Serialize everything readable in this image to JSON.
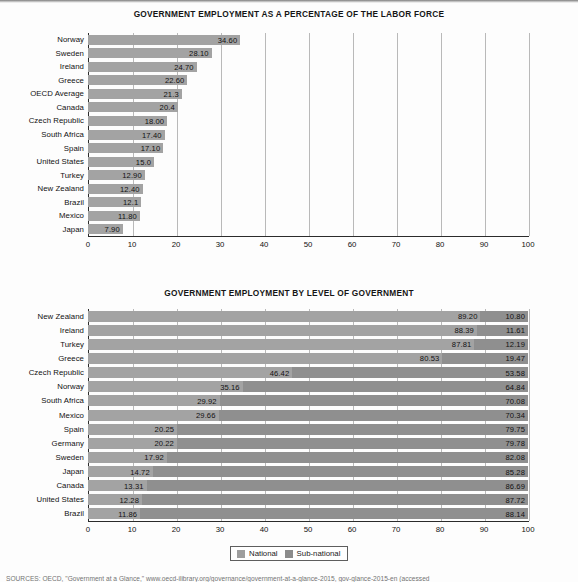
{
  "document": {
    "source_note": "SOURCES: OECD, \"Government at a Glance,\" www.oecd-ilibrary.org/governance/government-at-a-glance-2015, gov-glance-2015-en (accessed"
  },
  "legend": {
    "items": [
      {
        "label": "National",
        "color": "#9e9e9e"
      },
      {
        "label": "Sub-national",
        "color": "#8c8c8c"
      }
    ]
  },
  "chart_data": [
    {
      "type": "bar",
      "orientation": "horizontal",
      "title": "GOVERNMENT EMPLOYMENT AS A PERCENTAGE OF THE LABOR FORCE",
      "xlabel": "",
      "ylabel": "",
      "xlim": [
        0,
        100
      ],
      "xticks": [
        0,
        10,
        20,
        30,
        40,
        50,
        60,
        70,
        80,
        90,
        100
      ],
      "grid": true,
      "bar_color": "#a3a3a3",
      "categories": [
        "Norway",
        "Sweden",
        "Ireland",
        "Greece",
        "OECD Average",
        "Canada",
        "Czech Republic",
        "South Africa",
        "Spain",
        "United States",
        "Turkey",
        "New Zealand",
        "Brazil",
        "Mexico",
        "Japan"
      ],
      "values": [
        34.6,
        28.1,
        24.7,
        22.6,
        21.3,
        20.4,
        18.0,
        17.4,
        17.1,
        15.0,
        12.9,
        12.4,
        12.1,
        11.8,
        7.9
      ],
      "labels": [
        "34.60",
        "28.10",
        "24.70",
        "22.60",
        "21.3",
        "20.4",
        "18.00",
        "17.40",
        "17.10",
        "15.0",
        "12.90",
        "12.40",
        "12.1",
        "11.80",
        "7.90"
      ]
    },
    {
      "type": "bar",
      "orientation": "horizontal",
      "stacked": true,
      "title": "GOVERNMENT EMPLOYMENT BY LEVEL OF GOVERNMENT",
      "xlabel": "",
      "ylabel": "",
      "xlim": [
        0,
        100
      ],
      "xticks": [
        0,
        10,
        20,
        30,
        40,
        50,
        60,
        70,
        80,
        90,
        100
      ],
      "grid": true,
      "legend_position": "bottom-center",
      "categories": [
        "New Zealand",
        "Ireland",
        "Turkey",
        "Greece",
        "Czech Republic",
        "Norway",
        "South Africa",
        "Mexico",
        "Spain",
        "Germany",
        "Sweden",
        "Japan",
        "Canada",
        "United States",
        "Brazil"
      ],
      "series": [
        {
          "name": "National",
          "color": "#a3a3a3",
          "values": [
            89.2,
            88.39,
            87.81,
            80.53,
            46.42,
            35.16,
            29.92,
            29.66,
            20.25,
            20.22,
            17.92,
            14.72,
            13.31,
            12.28,
            11.86
          ],
          "labels": [
            "89.20",
            "88.39",
            "87.81",
            "80.53",
            "46.42",
            "35.16",
            "29.92",
            "29.66",
            "20.25",
            "20.22",
            "17.92",
            "14.72",
            "13.31",
            "12.28",
            "11.86"
          ]
        },
        {
          "name": "Sub-national",
          "color": "#8f8f8f",
          "values": [
            10.8,
            11.61,
            12.19,
            19.47,
            53.58,
            64.84,
            70.08,
            70.34,
            79.75,
            79.78,
            82.08,
            85.28,
            86.69,
            87.72,
            88.14
          ],
          "labels": [
            "10.80",
            "11.61",
            "12.19",
            "19.47",
            "53.58",
            "64.84",
            "70.08",
            "70.34",
            "79.75",
            "79.78",
            "82.08",
            "85.28",
            "86.69",
            "87.72",
            "88.14"
          ]
        }
      ]
    }
  ]
}
